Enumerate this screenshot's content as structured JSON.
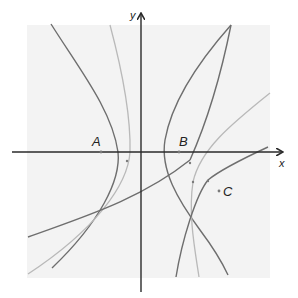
{
  "figure": {
    "colors": {
      "background_panel": "#f3f3f3",
      "axis": "#2a2a2a",
      "dark_curve": "#6e6e6e",
      "light_curve": "#b9b9b9",
      "point": "#7a7a7a",
      "label": "#222222"
    }
  },
  "axes": {
    "x_label": "x",
    "y_label": "y"
  },
  "points": [
    {
      "id": "A",
      "label": "A"
    },
    {
      "id": "B",
      "label": "B"
    },
    {
      "id": "C",
      "label": "C"
    }
  ],
  "curves": [
    {
      "id": "left-dark-hyperbola-branch",
      "tone": "dark"
    },
    {
      "id": "left-light-hyperbola-branch",
      "tone": "light"
    },
    {
      "id": "right-dark-hyperbola-branch",
      "tone": "dark"
    },
    {
      "id": "light-diagonal-curve",
      "tone": "light"
    },
    {
      "id": "dark-lower-curve",
      "tone": "dark"
    },
    {
      "id": "dark-crossing-line",
      "tone": "dark"
    }
  ]
}
